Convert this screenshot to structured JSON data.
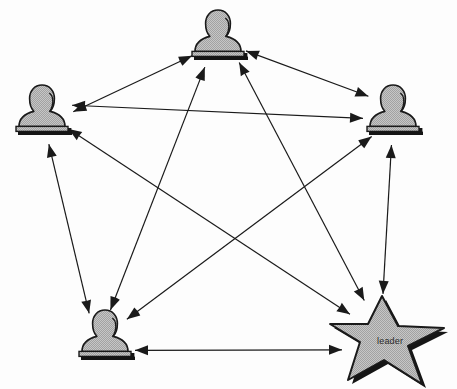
{
  "diagram": {
    "title": "",
    "type": "network-graph",
    "canvas": {
      "width": 457,
      "height": 389,
      "background": "#fdfdfd"
    },
    "style": {
      "node_fill": "#b9b9b9",
      "node_stroke": "#1a1a1a",
      "node_shadow": "#1a1a1a",
      "edge_color": "#1a1a1a",
      "label_color": "#2b2b2b"
    },
    "nodes": [
      {
        "id": "top",
        "name": "person-node-top",
        "shape": "person-bust",
        "label": "",
        "x": 218,
        "y": 40
      },
      {
        "id": "left",
        "name": "person-node-left",
        "shape": "person-bust",
        "label": "",
        "x": 42,
        "y": 115
      },
      {
        "id": "right",
        "name": "person-node-right",
        "shape": "person-bust",
        "label": "",
        "x": 393,
        "y": 115
      },
      {
        "id": "bottomleft",
        "name": "person-node-bottom-left",
        "shape": "person-bust",
        "label": "",
        "x": 105,
        "y": 340
      },
      {
        "id": "leader",
        "name": "leader-star-node",
        "shape": "star",
        "label": "leader",
        "x": 388,
        "y": 340
      }
    ],
    "edges": [
      {
        "from": "left",
        "to": "top",
        "direction": "bidirectional"
      },
      {
        "from": "left",
        "to": "right",
        "direction": "bidirectional"
      },
      {
        "from": "left",
        "to": "bottomleft",
        "direction": "bidirectional"
      },
      {
        "from": "left",
        "to": "leader",
        "direction": "bidirectional"
      },
      {
        "from": "top",
        "to": "right",
        "direction": "bidirectional"
      },
      {
        "from": "top",
        "to": "bottomleft",
        "direction": "bidirectional"
      },
      {
        "from": "top",
        "to": "leader",
        "direction": "bidirectional"
      },
      {
        "from": "right",
        "to": "bottomleft",
        "direction": "bidirectional"
      },
      {
        "from": "right",
        "to": "leader",
        "direction": "bidirectional"
      },
      {
        "from": "bottomleft",
        "to": "leader",
        "direction": "bidirectional"
      }
    ],
    "labels": [
      {
        "name": "leader-label",
        "text": "leader",
        "x": 377,
        "y": 336
      }
    ]
  }
}
